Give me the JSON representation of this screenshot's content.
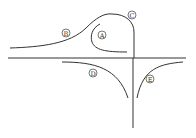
{
  "diagram": {
    "type": "curves-on-axes",
    "colors": {
      "line": "#333333",
      "background": "#ffffff"
    },
    "axes": {
      "horizontal": {
        "x1": 8,
        "x2": 186,
        "y": 58
      },
      "vertical": {
        "x": 133,
        "y1": 58,
        "y2": 128
      }
    },
    "curves": [
      {
        "id": "A",
        "label": "A",
        "label_pos": [
          102,
          35
        ]
      },
      {
        "id": "B",
        "label": "B",
        "label_pos": [
          66,
          33
        ]
      },
      {
        "id": "C",
        "label": "C",
        "label_pos": [
          132,
          15
        ]
      },
      {
        "id": "D",
        "label": "D",
        "label_pos": [
          93,
          73
        ]
      },
      {
        "id": "E",
        "label": "E",
        "label_pos": [
          150,
          79
        ]
      }
    ]
  }
}
